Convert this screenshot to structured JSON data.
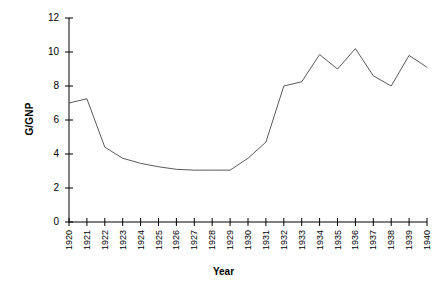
{
  "chart_data": {
    "type": "line",
    "title": "",
    "xlabel": "Year",
    "ylabel": "G/GNP",
    "categories": [
      "1920",
      "1921",
      "1922",
      "1923",
      "1924",
      "1925",
      "1926",
      "1927",
      "1928",
      "1929",
      "1930",
      "1931",
      "1932",
      "1933",
      "1934",
      "1935",
      "1936",
      "1937",
      "1938",
      "1939",
      "1940"
    ],
    "x": [
      1920,
      1921,
      1922,
      1923,
      1924,
      1925,
      1926,
      1927,
      1928,
      1929,
      1930,
      1931,
      1932,
      1933,
      1934,
      1935,
      1936,
      1937,
      1938,
      1939,
      1940
    ],
    "values": [
      7.0,
      7.25,
      4.4,
      3.75,
      3.45,
      3.25,
      3.1,
      3.05,
      3.05,
      3.05,
      3.75,
      4.7,
      8.0,
      8.25,
      9.85,
      9.0,
      10.2,
      8.6,
      8.0,
      9.8,
      9.1
    ],
    "series": [
      {
        "name": "G/GNP",
        "values": [
          7.0,
          7.25,
          4.4,
          3.75,
          3.45,
          3.25,
          3.1,
          3.05,
          3.05,
          3.05,
          3.75,
          4.7,
          8.0,
          8.25,
          9.85,
          9.0,
          10.2,
          8.6,
          8.0,
          9.8,
          9.1
        ]
      }
    ],
    "ylim": [
      0,
      12
    ],
    "yticks": [
      0,
      2,
      4,
      6,
      8,
      10,
      12
    ],
    "ytick_labels": [
      "0",
      "2",
      "4",
      "6",
      "8",
      "10",
      "12"
    ],
    "xlim": [
      1920,
      1940
    ],
    "grid": false,
    "legend": false,
    "line_color": "#5a5a5a",
    "axis_color": "#000000",
    "background_color": "#ffffff"
  },
  "axes": {
    "y_title": "G/GNP",
    "x_title": "Year"
  }
}
